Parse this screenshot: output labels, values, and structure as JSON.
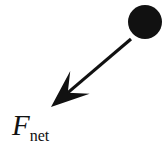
{
  "figure": {
    "kind": "physics-free-body-vector-diagram",
    "width": 168,
    "height": 149,
    "background_color": "#ffffff",
    "ink_color": "#111111"
  },
  "label": {
    "full_text": "Fnet",
    "symbol": "F",
    "subscript": "net",
    "meaning": "net force",
    "x": 12,
    "y": 111
  },
  "ball": {
    "name": "mass-circle",
    "fill_color": "#111111",
    "center_x": 145,
    "center_y": 22,
    "radius": 17
  },
  "vector": {
    "name": "net-force-arrow",
    "color": "#111111",
    "shaft_width": 3.2,
    "tail_x": 131,
    "tail_y": 39,
    "tip_x": 51,
    "tip_y": 107,
    "direction": "down-left",
    "angle_degrees": 220,
    "arrowhead_style": "barbed-swept-back"
  }
}
